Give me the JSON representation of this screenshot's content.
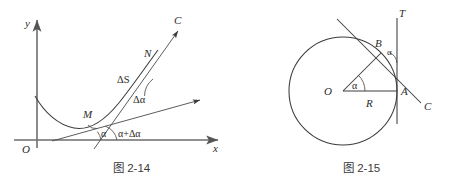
{
  "page": {
    "width": 465,
    "height": 188,
    "background": "#ffffff",
    "ink": "#3c3c3c"
  },
  "figures": [
    {
      "id": "fig-2-14",
      "caption": "图 2-14",
      "description": "Curve with tangent lines at points M and N showing arc length ΔS and turning angle Δα",
      "axes": {
        "x_label": "x",
        "y_label": "y",
        "origin_label": "O"
      },
      "labels": {
        "point_m": "M",
        "point_n": "N",
        "curve_c": "C",
        "arc_length": "ΔS",
        "angle_alpha": "α",
        "angle_alpha_plus": "α+Δα",
        "angle_delta_alpha": "Δα"
      }
    },
    {
      "id": "fig-2-15",
      "caption": "图 2-15",
      "description": "Circle of radius R with center O, tangent line T at A, secant to B making angle α",
      "labels": {
        "center": "O",
        "radius": "R",
        "point_a": "A",
        "point_b": "B",
        "tangent_t": "T",
        "line_c": "C",
        "angle_center": "α",
        "angle_at_b": "α"
      }
    }
  ]
}
